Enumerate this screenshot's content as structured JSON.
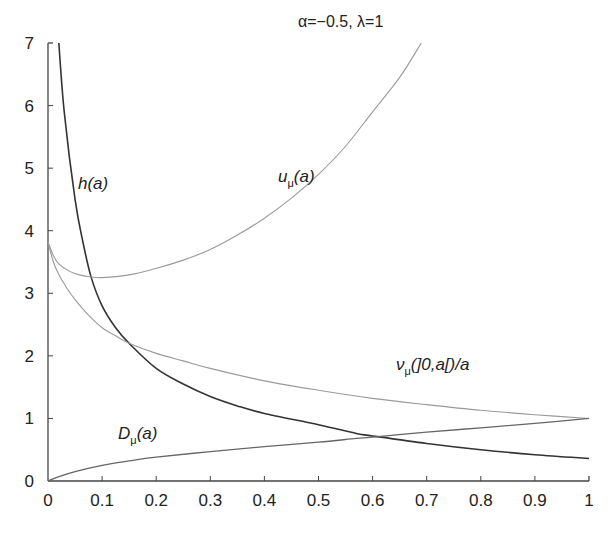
{
  "chart_data": {
    "type": "line",
    "title": "α=−0.5, λ=1",
    "xlabel": "",
    "ylabel": "",
    "xlim": [
      0,
      1
    ],
    "ylim": [
      0,
      7
    ],
    "grid": false,
    "legend": "inline labels",
    "x_ticks": [
      "0",
      "0.1",
      "0.2",
      "0.3",
      "0.4",
      "0.5",
      "0.6",
      "0.7",
      "0.8",
      "0.9",
      "1"
    ],
    "y_ticks": [
      "0",
      "1",
      "2",
      "3",
      "4",
      "5",
      "6",
      "7"
    ],
    "series": [
      {
        "name": "h(a)",
        "label_main": "h(a)",
        "label_sub": "",
        "label_tail": "",
        "color": "#333333",
        "width": 1.6,
        "label_pos": [
          78,
          189
        ],
        "points": [
          [
            0.02,
            7
          ],
          [
            0.03,
            5.9
          ],
          [
            0.05,
            4.5
          ],
          [
            0.065,
            3.8
          ],
          [
            0.08,
            3.25
          ],
          [
            0.1,
            2.8
          ],
          [
            0.125,
            2.45
          ],
          [
            0.15,
            2.2
          ],
          [
            0.2,
            1.8
          ],
          [
            0.25,
            1.55
          ],
          [
            0.3,
            1.35
          ],
          [
            0.35,
            1.2
          ],
          [
            0.4,
            1.08
          ],
          [
            0.5,
            0.9
          ],
          [
            0.57,
            0.76
          ],
          [
            0.6,
            0.72
          ],
          [
            0.7,
            0.6
          ],
          [
            0.8,
            0.5
          ],
          [
            0.9,
            0.42
          ],
          [
            1.0,
            0.36
          ]
        ]
      },
      {
        "name": "u_μ(a)",
        "label_main": "u",
        "label_sub": "μ",
        "label_tail": "(a)",
        "color": "#9a9a9a",
        "width": 1.1,
        "label_pos": [
          278,
          182
        ],
        "points": [
          [
            0,
            3.82
          ],
          [
            0.01,
            3.6
          ],
          [
            0.02,
            3.47
          ],
          [
            0.04,
            3.35
          ],
          [
            0.06,
            3.29
          ],
          [
            0.08,
            3.26
          ],
          [
            0.1,
            3.25
          ],
          [
            0.13,
            3.27
          ],
          [
            0.16,
            3.31
          ],
          [
            0.2,
            3.4
          ],
          [
            0.25,
            3.53
          ],
          [
            0.3,
            3.7
          ],
          [
            0.35,
            3.93
          ],
          [
            0.4,
            4.2
          ],
          [
            0.45,
            4.52
          ],
          [
            0.5,
            4.9
          ],
          [
            0.55,
            5.35
          ],
          [
            0.6,
            5.9
          ],
          [
            0.65,
            6.45
          ],
          [
            0.69,
            7.0
          ]
        ]
      },
      {
        "name": "ν_μ(]0,a[)/a",
        "label_main": "ν",
        "label_sub": "μ",
        "label_tail": "(]0,a[)/a",
        "color": "#9a9a9a",
        "width": 1.1,
        "label_pos": [
          396,
          370
        ],
        "points": [
          [
            0,
            3.82
          ],
          [
            0.01,
            3.5
          ],
          [
            0.02,
            3.3
          ],
          [
            0.035,
            3.08
          ],
          [
            0.05,
            2.9
          ],
          [
            0.075,
            2.65
          ],
          [
            0.1,
            2.45
          ],
          [
            0.125,
            2.32
          ],
          [
            0.15,
            2.2
          ],
          [
            0.2,
            2.04
          ],
          [
            0.25,
            1.92
          ],
          [
            0.3,
            1.8
          ],
          [
            0.4,
            1.6
          ],
          [
            0.5,
            1.45
          ],
          [
            0.6,
            1.32
          ],
          [
            0.7,
            1.22
          ],
          [
            0.8,
            1.13
          ],
          [
            0.9,
            1.06
          ],
          [
            1.0,
            1.0
          ]
        ]
      },
      {
        "name": "D_μ(a)",
        "label_main": "D",
        "label_sub": "μ",
        "label_tail": "(a)",
        "color": "#666666",
        "width": 1.3,
        "label_pos": [
          118,
          439
        ],
        "points": [
          [
            0,
            0
          ],
          [
            0.02,
            0.07
          ],
          [
            0.05,
            0.15
          ],
          [
            0.1,
            0.25
          ],
          [
            0.15,
            0.32
          ],
          [
            0.2,
            0.38
          ],
          [
            0.3,
            0.47
          ],
          [
            0.4,
            0.55
          ],
          [
            0.5,
            0.62
          ],
          [
            0.57,
            0.68
          ],
          [
            0.6,
            0.7
          ],
          [
            0.7,
            0.78
          ],
          [
            0.8,
            0.85
          ],
          [
            0.9,
            0.92
          ],
          [
            1.0,
            1.0
          ]
        ]
      }
    ]
  },
  "plot_area": {
    "x0_px": 48,
    "x1_px": 589,
    "y0_px": 481,
    "y7_px": 43
  },
  "title_pos": [
    298,
    27
  ]
}
